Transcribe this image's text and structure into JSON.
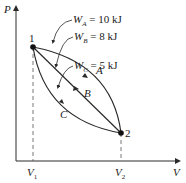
{
  "diagram": {
    "type": "P-V diagram",
    "axes": {
      "y_label": "P",
      "x_label": "V"
    },
    "states": [
      {
        "id": "1",
        "label": "1",
        "volume_label": "V",
        "volume_sub": "1"
      },
      {
        "id": "2",
        "label": "2",
        "volume_label": "V",
        "volume_sub": "2"
      }
    ],
    "paths": [
      {
        "name": "A",
        "label": "A",
        "work_symbol": "W",
        "work_sub": "A",
        "work_value": "= 10 kJ"
      },
      {
        "name": "B",
        "label": "B",
        "work_symbol": "W",
        "work_sub": "B",
        "work_value": "= 8 kJ"
      },
      {
        "name": "C",
        "label": "C",
        "work_symbol": "W",
        "work_sub": "C",
        "work_value": "= 5 kJ"
      }
    ],
    "colors": {
      "line": "#2a2a2a",
      "dashed": "#555555",
      "background": "#ffffff"
    }
  }
}
